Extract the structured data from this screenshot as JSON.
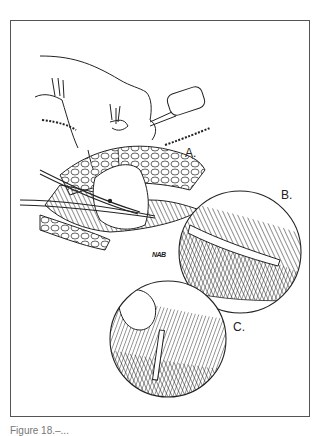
{
  "figure": {
    "type": "surgical line-art illustration",
    "panels": [
      {
        "label": "A.",
        "description": "Hand lifting tissue with forceps over incision; scissors cutting; retractor clip"
      },
      {
        "label": "B.",
        "description": "Magnified inset of scissors dissecting layered tissue"
      },
      {
        "label": "C.",
        "description": "Magnified inset of fold with drain/suture tube"
      }
    ],
    "signature": "NAB",
    "caption": "Figure 18.–..."
  }
}
